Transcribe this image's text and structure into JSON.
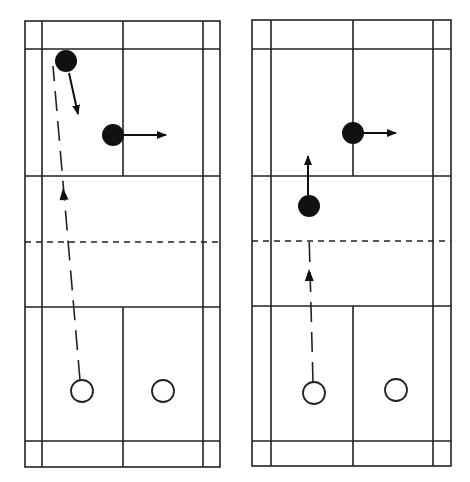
{
  "diagram": {
    "title": "",
    "colors": {
      "background": "#ffffff",
      "line": "#222222",
      "player_filled": "#111111",
      "player_open_fill": "#ffffff"
    },
    "courts": [
      {
        "id": "court-left",
        "outer": {
          "x1": 25,
          "y1": 21,
          "x2": 220,
          "y2": 467
        },
        "singles_sidelines": [
          42,
          203
        ],
        "center_line_x": 123,
        "back_service_lines_y": [
          49,
          441
        ],
        "short_service_lines_y": [
          176,
          307
        ],
        "net_y": 242,
        "players_filled": [
          {
            "id": "player-a",
            "cx": 66,
            "cy": 61,
            "r": 11
          },
          {
            "id": "player-b",
            "cx": 113,
            "cy": 135,
            "r": 11
          }
        ],
        "players_open": [
          {
            "id": "player-c",
            "cx": 82,
            "cy": 391,
            "r": 11
          },
          {
            "id": "player-d",
            "cx": 163,
            "cy": 391,
            "r": 11
          }
        ],
        "movement_arrows": [
          {
            "id": "move-a",
            "x1": 69,
            "y1": 73,
            "x2": 78,
            "y2": 114
          },
          {
            "id": "move-b",
            "x1": 124,
            "y1": 135,
            "x2": 166,
            "y2": 135
          }
        ],
        "shuttle_path": {
          "id": "shuttle-left",
          "points": [
            [
              80,
              380
            ],
            [
              53,
              66
            ]
          ],
          "arrow_at": {
            "x": 63,
            "y": 188,
            "dir": "up"
          }
        }
      },
      {
        "id": "court-right",
        "outer": {
          "x1": 252,
          "y1": 20,
          "x2": 451,
          "y2": 466
        },
        "singles_sidelines": [
          271,
          433
        ],
        "center_line_x": 353,
        "back_service_lines_y": [
          49,
          441
        ],
        "short_service_lines_y": [
          176,
          306
        ],
        "net_y": 241,
        "players_filled": [
          {
            "id": "player-e",
            "cx": 353,
            "cy": 133,
            "r": 11
          },
          {
            "id": "player-f",
            "cx": 309,
            "cy": 206,
            "r": 11
          }
        ],
        "players_open": [
          {
            "id": "player-g",
            "cx": 314,
            "cy": 393,
            "r": 11
          },
          {
            "id": "player-h",
            "cx": 396,
            "cy": 390,
            "r": 11
          }
        ],
        "movement_arrows": [
          {
            "id": "move-e",
            "x1": 364,
            "y1": 133,
            "x2": 396,
            "y2": 133
          },
          {
            "id": "move-f",
            "x1": 308,
            "y1": 195,
            "x2": 308,
            "y2": 156
          }
        ],
        "shuttle_path": {
          "id": "shuttle-right",
          "points": [
            [
              313,
              382
            ],
            [
              309,
              232
            ]
          ],
          "arrow_at": {
            "x": 309,
            "y": 269,
            "dir": "up"
          }
        }
      }
    ]
  }
}
